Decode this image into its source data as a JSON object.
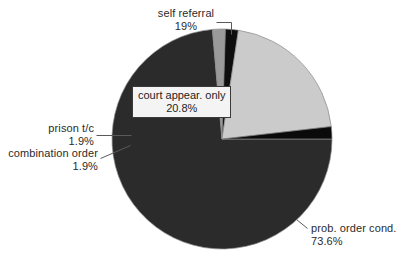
{
  "chart_data": {
    "type": "pie",
    "title": "",
    "subtitle": "",
    "xlabel": "",
    "ylabel": "",
    "legend_position": "none",
    "grid": false,
    "units": "percent",
    "categories": [
      "prob. order cond.",
      "self referral",
      "court appear. only",
      "prison t/c",
      "combination order"
    ],
    "values": [
      73.6,
      1.9,
      20.8,
      1.9,
      1.9
    ],
    "labels_as_shown": [
      "73.6%",
      "19%",
      "20.8%",
      "1.9%",
      "1.9%"
    ],
    "slices": [
      {
        "name": "prob. order cond.",
        "label": "prob. order cond.",
        "value_label": "73.6%",
        "value": 73.6,
        "color": "#2b2b2b",
        "start_deg": 0,
        "sweep_deg": 265.0,
        "callout": "outside-right-bottom"
      },
      {
        "name": "combination order",
        "label": "combination order",
        "value_label": "1.9%",
        "value": 1.9,
        "color": "#9a9a9a",
        "start_deg": 265.0,
        "sweep_deg": 6.8,
        "callout": "outside-left"
      },
      {
        "name": "prison t/c",
        "label": "prison t/c",
        "value_label": "1.9%",
        "value": 1.9,
        "color": "#0e0e0e",
        "start_deg": 271.8,
        "sweep_deg": 6.8,
        "callout": "outside-left"
      },
      {
        "name": "court appear. only",
        "label": "court appear. only",
        "value_label": "20.8%",
        "value": 20.8,
        "color": "#cbcbcb",
        "start_deg": 278.6,
        "sweep_deg": 74.9,
        "callout": "inside-box"
      },
      {
        "name": "self referral",
        "label": "self referral",
        "value_label": "19%",
        "value": 1.9,
        "color": "#0a0a0a",
        "start_deg": 353.5,
        "sweep_deg": 6.5,
        "callout": "outside-top"
      }
    ],
    "geometry": {
      "cx": 222,
      "cy": 139,
      "r": 110
    }
  },
  "labels": {
    "self_referral": {
      "name": "self referral",
      "value": "19%"
    },
    "court_appear": {
      "name": "court appear. only",
      "value": "20.8%"
    },
    "prison_tc": {
      "name": "prison t/c",
      "value": "1.9%"
    },
    "combination_order": {
      "name": "combination order",
      "value": "1.9%"
    },
    "prob_order": {
      "name": "prob. order cond.",
      "value": "73.6%"
    }
  },
  "colors": {
    "background": "#ffffff",
    "text": "#2b2b2b",
    "slice_dark": "#2b2b2b",
    "slice_black": "#0a0a0a",
    "slice_light_gray": "#cbcbcb",
    "slice_mid_gray": "#9a9a9a",
    "outline": "#8a8a8a",
    "leader": "#5a5a5a",
    "box_fill": "#f4f4f4",
    "box_border": "#3a3a3a"
  }
}
